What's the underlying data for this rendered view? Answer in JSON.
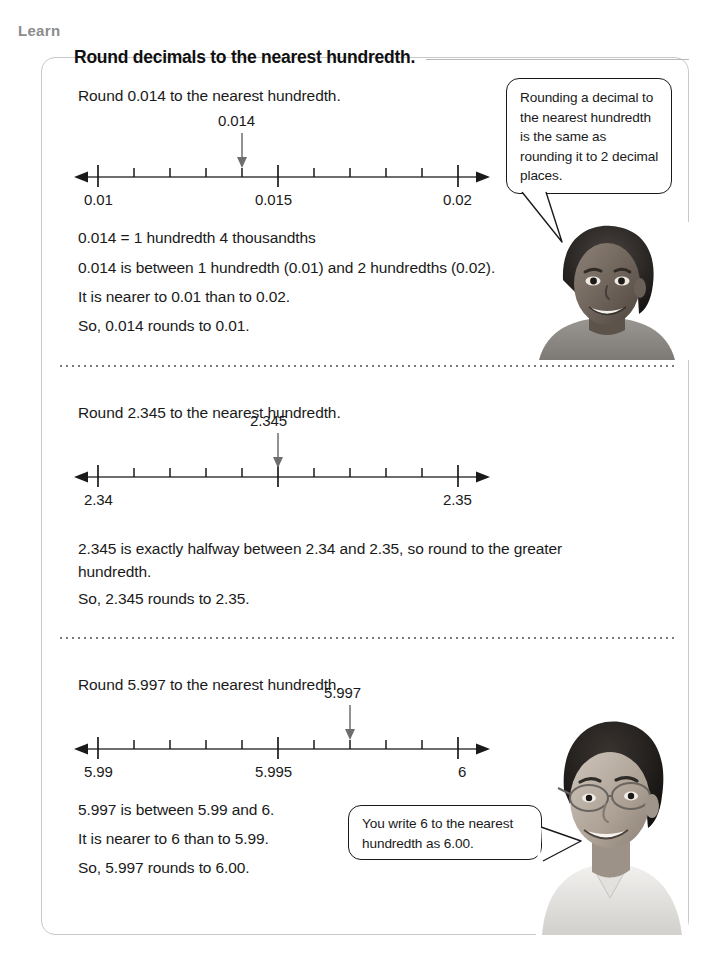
{
  "page": {
    "learn_tab_label": "Learn",
    "heading": "Round decimals to the nearest hundredth."
  },
  "sections": [
    {
      "id": "section-1",
      "prompt": "Round 0.014 to the nearest hundredth.",
      "numberline": {
        "marker_label": "0.014",
        "marker_index": 4,
        "intervals": 10,
        "ticks": [
          {
            "index": 0,
            "label": "0.01",
            "major": true
          },
          {
            "index": 5,
            "label": "0.015",
            "major": true
          },
          {
            "index": 10,
            "label": "0.02",
            "major": true
          }
        ]
      },
      "lines": [
        "0.014 = 1 hundredth 4 thousandths",
        "0.014 is between 1 hundredth (0.01) and 2 hundredths (0.02).",
        "It is nearer to 0.01 than to 0.02.",
        "So, 0.014 rounds to 0.01."
      ]
    },
    {
      "id": "section-2",
      "prompt": "Round 2.345 to the nearest hundredth.",
      "numberline": {
        "marker_label": "2.345",
        "marker_index": 5,
        "intervals": 10,
        "ticks": [
          {
            "index": 0,
            "label": "2.34",
            "major": true
          },
          {
            "index": 5,
            "label": "",
            "major": true
          },
          {
            "index": 10,
            "label": "2.35",
            "major": true
          }
        ]
      },
      "lines": [
        "2.345 is exactly halfway between 2.34 and 2.35, so round to the greater hundredth.",
        "So, 2.345 rounds to 2.35."
      ]
    },
    {
      "id": "section-3",
      "prompt": "Round 5.997 to the nearest hundredth.",
      "numberline": {
        "marker_label": "5.997",
        "marker_index": 7,
        "intervals": 10,
        "ticks": [
          {
            "index": 0,
            "label": "5.99",
            "major": true
          },
          {
            "index": 5,
            "label": "5.995",
            "major": true
          },
          {
            "index": 10,
            "label": "6",
            "major": true
          }
        ]
      },
      "lines": [
        "5.997 is between 5.99 and 6.",
        "It is nearer to 6 than to 5.99.",
        "So, 5.997 rounds to 6.00."
      ]
    }
  ],
  "bubbles": [
    {
      "id": "bubble-girl",
      "text": "Rounding a decimal to the nearest hundredth is the same as rounding it to 2 decimal places."
    },
    {
      "id": "bubble-boy",
      "text": "You write 6 to the nearest hundredth as 6.00."
    }
  ],
  "photos": [
    {
      "id": "photo-girl",
      "caption": "smiling girl"
    },
    {
      "id": "photo-boy",
      "caption": "boy with glasses"
    }
  ],
  "colors": {
    "ink": "#1a1a1a",
    "rule": "#b9b9b9",
    "frame": "#c9c9c9",
    "learn_gray": "#8c8c8c",
    "line_gray": "#6e6e6e"
  }
}
